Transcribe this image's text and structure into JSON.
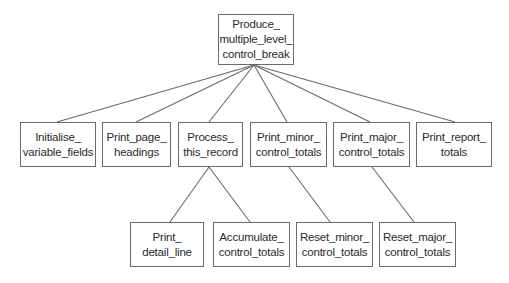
{
  "diagram": {
    "type": "structure-chart",
    "line_color": "#6a6a6a",
    "nodes": [
      {
        "id": "root",
        "lines": [
          "Produce_",
          "multiple_level_",
          "control_break"
        ],
        "x": 218,
        "y": 14,
        "w": 76,
        "h": 51
      },
      {
        "id": "initialise",
        "lines": [
          "Initialise_",
          "variable_fields"
        ],
        "x": 20,
        "y": 122,
        "w": 76,
        "h": 45
      },
      {
        "id": "print-page-headings",
        "lines": [
          "Print_page_",
          "headings"
        ],
        "x": 102,
        "y": 122,
        "w": 69,
        "h": 45
      },
      {
        "id": "process-this-record",
        "lines": [
          "Process_",
          "this_record"
        ],
        "x": 178,
        "y": 122,
        "w": 65,
        "h": 45
      },
      {
        "id": "print-minor-control-totals",
        "lines": [
          "Print_minor_",
          "control_totals"
        ],
        "x": 250,
        "y": 122,
        "w": 77,
        "h": 45
      },
      {
        "id": "print-major-control-totals",
        "lines": [
          "Print_major_",
          "control_totals"
        ],
        "x": 333,
        "y": 122,
        "w": 77,
        "h": 45
      },
      {
        "id": "print-report-totals",
        "lines": [
          "Print_report_",
          "totals"
        ],
        "x": 416,
        "y": 122,
        "w": 76,
        "h": 45
      },
      {
        "id": "print-detail-line",
        "lines": [
          "Print_",
          "detail_line"
        ],
        "x": 130,
        "y": 222,
        "w": 74,
        "h": 45
      },
      {
        "id": "accumulate-control-totals",
        "lines": [
          "Accumulate_",
          "control_totals"
        ],
        "x": 213,
        "y": 222,
        "w": 77,
        "h": 45
      },
      {
        "id": "reset-minor-control-totals",
        "lines": [
          "Reset_minor_",
          "control_totals"
        ],
        "x": 296,
        "y": 222,
        "w": 77,
        "h": 45
      },
      {
        "id": "reset-major-control-totals",
        "lines": [
          "Reset_major_",
          "control_totals"
        ],
        "x": 379,
        "y": 222,
        "w": 77,
        "h": 45
      }
    ],
    "edges": [
      {
        "from": "root",
        "to": "initialise",
        "x1": 254,
        "y1": 65,
        "x2": 57,
        "y2": 122
      },
      {
        "from": "root",
        "to": "print-page-headings",
        "x1": 254,
        "y1": 65,
        "x2": 136,
        "y2": 122
      },
      {
        "from": "root",
        "to": "process-this-record",
        "x1": 254,
        "y1": 65,
        "x2": 209,
        "y2": 122
      },
      {
        "from": "root",
        "to": "print-minor-control-totals",
        "x1": 254,
        "y1": 65,
        "x2": 287,
        "y2": 122
      },
      {
        "from": "root",
        "to": "print-major-control-totals",
        "x1": 254,
        "y1": 65,
        "x2": 370,
        "y2": 122
      },
      {
        "from": "root",
        "to": "print-report-totals",
        "x1": 254,
        "y1": 65,
        "x2": 455,
        "y2": 122
      },
      {
        "from": "process-this-record",
        "to": "print-detail-line",
        "x1": 209,
        "y1": 167,
        "x2": 170,
        "y2": 222
      },
      {
        "from": "process-this-record",
        "to": "accumulate-control-totals",
        "x1": 209,
        "y1": 167,
        "x2": 250,
        "y2": 222
      },
      {
        "from": "print-minor-control-totals",
        "to": "reset-minor-control-totals",
        "x1": 289,
        "y1": 167,
        "x2": 330,
        "y2": 222
      },
      {
        "from": "print-major-control-totals",
        "to": "reset-major-control-totals",
        "x1": 372,
        "y1": 167,
        "x2": 414,
        "y2": 222
      }
    ]
  }
}
